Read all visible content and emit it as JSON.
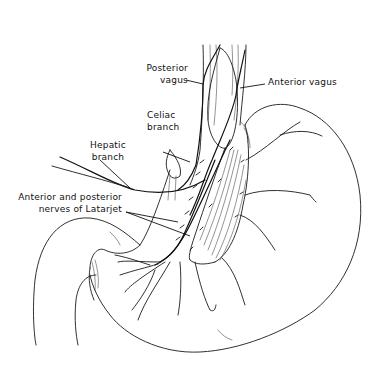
{
  "figure": {
    "labels": {
      "posterior_vagus": [
        "Posterior",
        "vagus"
      ],
      "anterior_vagus": "Anterior vagus",
      "celiac_branch": [
        "Celiac",
        "branch"
      ],
      "hepatic_branch": [
        "Hepatic",
        "branch"
      ],
      "latarjet": [
        "Anterior and posterior",
        "nerves of Latarjet"
      ]
    },
    "colors": {
      "line": "#1a1a1a",
      "background": "#ffffff"
    }
  }
}
